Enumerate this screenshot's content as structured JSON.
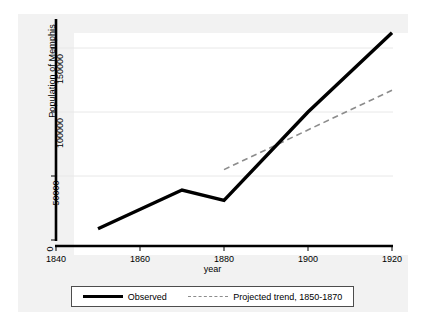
{
  "chart_data": {
    "type": "line",
    "title": "",
    "xlabel": "year",
    "ylabel": "Population of Memphis",
    "xlim": [
      1840,
      1920
    ],
    "ylim": [
      0,
      165000
    ],
    "xticks": [
      1840,
      1860,
      1880,
      1900,
      1920
    ],
    "yticks": [
      0,
      50000,
      100000,
      150000
    ],
    "ytick_labels": [
      "0",
      "50000",
      "100000",
      "150000"
    ],
    "xtick_labels": [
      "1840",
      "1860",
      "1880",
      "1900",
      "1920"
    ],
    "grid": "horizontal",
    "legend_position": "below",
    "series": [
      {
        "name": "Observed",
        "style": "solid",
        "color": "#000000",
        "x": [
          1850,
          1870,
          1880,
          1900,
          1920
        ],
        "values": [
          8800,
          39000,
          31000,
          100000,
          162000
        ]
      },
      {
        "name": "Projected trend, 1850-1870",
        "style": "dashed",
        "color": "#8c8c8c",
        "x": [
          1880,
          1920
        ],
        "values": [
          55000,
          117000
        ]
      }
    ]
  },
  "axes": {
    "y_title": "Population of Memphis",
    "x_title": "year",
    "y_tick_labels": [
      "0",
      "50000",
      "100000",
      "150000"
    ],
    "x_tick_labels": [
      "1840",
      "1860",
      "1880",
      "1900",
      "1920"
    ]
  },
  "legend": {
    "entries": [
      {
        "label": "Observed",
        "key": "solid-line-key"
      },
      {
        "label": "Projected trend, 1850-1870",
        "key": "dashed-line-key"
      }
    ]
  },
  "colors": {
    "observed": "#000000",
    "projected": "#8c8c8c",
    "graph_region": "#f2f2f2",
    "plot_background": "#ffffff",
    "grid": "#e8e8e8",
    "axis": "#000000"
  }
}
